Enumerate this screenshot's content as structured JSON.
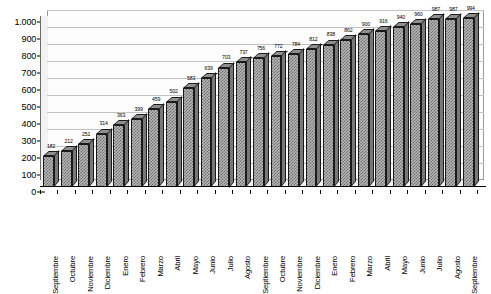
{
  "chart_data": {
    "type": "bar",
    "title": "",
    "subtitle": "",
    "xlabel": "",
    "ylabel": "",
    "ylim": [
      0,
      1000
    ],
    "ytick_step": 100,
    "ytick_labels": [
      "1.000",
      "900",
      "800",
      "700",
      "600",
      "500",
      "400",
      "300",
      "200",
      "100",
      "0"
    ],
    "ytick_values": [
      1000,
      900,
      800,
      700,
      600,
      500,
      400,
      300,
      200,
      100,
      0
    ],
    "grid": true,
    "legend": "none",
    "style": "3d-bar",
    "bar_fill_color": "#b8b8b8",
    "bar_hatch_color": "#6e6e6e",
    "bar_outline_color": "#1a1a1a",
    "plot_background": "#fdfdfd",
    "gridline_color": "#c2c2c2",
    "categories": [
      "Septiembre",
      "Octubre",
      "Noviembre",
      "Diciembre",
      "Enero",
      "Febrero",
      "Marzo",
      "Abril",
      "Mayo",
      "Junio",
      "Julio",
      "Agosto",
      "Septiembre",
      "Octubre",
      "Noviembre",
      "Diciembre",
      "Enero",
      "Febrero",
      "Marzo",
      "Abril",
      "Mayo",
      "Junio",
      "Julio",
      "Agosto",
      "Septiembre"
    ],
    "values": [
      182,
      212,
      251,
      314,
      363,
      399,
      459,
      502,
      583,
      639,
      703,
      737,
      756,
      772,
      784,
      812,
      838,
      862,
      900,
      916,
      940,
      960,
      987,
      987,
      994
    ],
    "data_labels": [
      "182",
      "212",
      "251",
      "314",
      "363",
      "399",
      "459",
      "502",
      "583",
      "639",
      "703",
      "737",
      "756",
      "772",
      "784",
      "812",
      "838",
      "862",
      "900",
      "916",
      "940",
      "960",
      "987",
      "987",
      "994"
    ],
    "bar_count": 25
  }
}
